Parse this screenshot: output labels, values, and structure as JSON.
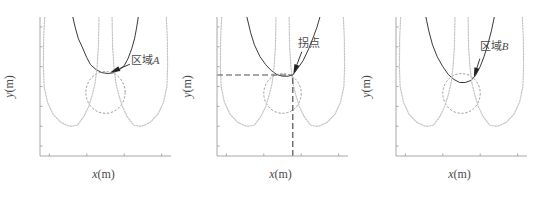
{
  "figure": {
    "panel_count": 3
  },
  "chart_data": [
    {
      "type": "line",
      "caption": "(a)",
      "xlabel": "x(m)",
      "ylabel": "y(m)",
      "xlim": [
        0.15,
        0.85
      ],
      "ylim": [
        0.15,
        0.85
      ],
      "xticks": [
        0.2,
        0.4,
        0.6,
        0.8
      ],
      "xtick_labels": [
        "0.2",
        "0.4",
        "0.6",
        "0.8"
      ],
      "yticks": [
        0.2,
        0.3,
        0.4,
        0.5,
        0.6,
        0.7,
        0.8
      ],
      "ytick_labels": [
        "0.2",
        "0.3",
        "0.4",
        "0.5",
        "0.6",
        "0.7",
        "0.8"
      ],
      "grid": false,
      "series": [
        {
          "name": "1",
          "style": "solid",
          "color": "#3a3a3a",
          "points": [
            [
              0.325,
              0.85
            ],
            [
              0.34,
              0.79
            ],
            [
              0.355,
              0.74
            ],
            [
              0.375,
              0.7
            ],
            [
              0.4,
              0.645
            ],
            [
              0.42,
              0.61
            ],
            [
              0.45,
              0.585
            ],
            [
              0.48,
              0.57
            ],
            [
              0.515,
              0.565
            ],
            [
              0.545,
              0.57
            ],
            [
              0.575,
              0.585
            ],
            [
              0.6,
              0.605
            ],
            [
              0.62,
              0.64
            ],
            [
              0.64,
              0.69
            ],
            [
              0.655,
              0.74
            ],
            [
              0.665,
              0.79
            ],
            [
              0.675,
              0.85
            ]
          ],
          "label_pos": [
            0.385,
            0.77
          ]
        },
        {
          "name": "2",
          "style": "dashed",
          "color": "#8a8a8a",
          "shape": "circle",
          "center": [
            0.5,
            0.47
          ],
          "radius": 0.105,
          "label_pos": [
            0.5,
            0.39
          ]
        },
        {
          "name": "3",
          "style": "dotted",
          "color": "#c4c4c4",
          "points": [
            [
              0.175,
              0.85
            ],
            [
              0.17,
              0.75
            ],
            [
              0.168,
              0.6
            ],
            [
              0.172,
              0.5
            ],
            [
              0.19,
              0.42
            ],
            [
              0.22,
              0.36
            ],
            [
              0.26,
              0.32
            ],
            [
              0.3,
              0.302
            ],
            [
              0.32,
              0.3
            ],
            [
              0.35,
              0.305
            ],
            [
              0.385,
              0.35
            ],
            [
              0.41,
              0.4
            ],
            [
              0.43,
              0.46
            ],
            [
              0.445,
              0.52
            ],
            [
              0.455,
              0.6
            ],
            [
              0.462,
              0.7
            ],
            [
              0.465,
              0.85
            ]
          ],
          "label_pos": [
            0.325,
            0.315
          ]
        },
        {
          "name": "3",
          "style": "dotted",
          "color": "#c4c4c4",
          "points": [
            [
              0.825,
              0.85
            ],
            [
              0.83,
              0.75
            ],
            [
              0.832,
              0.6
            ],
            [
              0.828,
              0.5
            ],
            [
              0.81,
              0.42
            ],
            [
              0.78,
              0.36
            ],
            [
              0.74,
              0.32
            ],
            [
              0.7,
              0.302
            ],
            [
              0.68,
              0.3
            ],
            [
              0.65,
              0.305
            ],
            [
              0.615,
              0.35
            ],
            [
              0.59,
              0.4
            ],
            [
              0.57,
              0.46
            ],
            [
              0.555,
              0.52
            ],
            [
              0.545,
              0.6
            ],
            [
              0.538,
              0.7
            ],
            [
              0.535,
              0.85
            ]
          ],
          "label_pos": [
            0.68,
            0.315
          ]
        }
      ],
      "annotations": [
        {
          "text": "区域A",
          "text_pos": [
            0.635,
            0.615
          ],
          "arrow_from": [
            0.63,
            0.612
          ],
          "arrow_to": [
            0.525,
            0.57
          ]
        }
      ],
      "guides": []
    },
    {
      "type": "line",
      "caption": "(b)",
      "xlabel": "x(m)",
      "ylabel": "y(m)",
      "xlim": [
        0.15,
        0.85
      ],
      "ylim": [
        0.15,
        0.85
      ],
      "xticks": [
        0.2,
        0.4,
        0.6,
        0.8
      ],
      "xtick_labels": [
        "0.2",
        "0.4",
        "0.6",
        "0.8"
      ],
      "yticks": [
        0.2,
        0.3,
        0.4,
        0.5,
        0.6,
        0.7,
        0.8
      ],
      "ytick_labels": [
        "0.2",
        "0.3",
        "0.4",
        "0.5",
        "0.6",
        "0.7",
        "0.8"
      ],
      "grid": false,
      "series": [
        {
          "name": "1",
          "style": "solid",
          "color": "#3a3a3a",
          "points": [
            [
              0.31,
              0.85
            ],
            [
              0.33,
              0.77
            ],
            [
              0.35,
              0.71
            ],
            [
              0.38,
              0.65
            ],
            [
              0.41,
              0.61
            ],
            [
              0.44,
              0.58
            ],
            [
              0.47,
              0.56
            ],
            [
              0.5,
              0.552
            ],
            [
              0.53,
              0.552
            ],
            [
              0.555,
              0.558
            ],
            [
              0.58,
              0.59
            ],
            [
              0.61,
              0.63
            ],
            [
              0.64,
              0.69
            ],
            [
              0.665,
              0.75
            ],
            [
              0.685,
              0.8
            ],
            [
              0.7,
              0.85
            ]
          ],
          "label_pos": [
            0.37,
            0.77
          ]
        },
        {
          "name": "2",
          "style": "dashed",
          "color": "#8a8a8a",
          "shape": "circle",
          "center": [
            0.5,
            0.465
          ],
          "radius": 0.1,
          "label_pos": [
            0.49,
            0.39
          ]
        },
        {
          "name": "3",
          "style": "dotted",
          "color": "#c4c4c4",
          "points": [
            [
              0.175,
              0.85
            ],
            [
              0.17,
              0.75
            ],
            [
              0.168,
              0.6
            ],
            [
              0.172,
              0.5
            ],
            [
              0.19,
              0.42
            ],
            [
              0.22,
              0.36
            ],
            [
              0.26,
              0.32
            ],
            [
              0.3,
              0.302
            ],
            [
              0.32,
              0.3
            ],
            [
              0.35,
              0.305
            ],
            [
              0.385,
              0.35
            ],
            [
              0.41,
              0.4
            ],
            [
              0.43,
              0.46
            ],
            [
              0.445,
              0.52
            ],
            [
              0.455,
              0.6
            ],
            [
              0.462,
              0.7
            ],
            [
              0.465,
              0.85
            ]
          ],
          "label_pos": [
            0.33,
            0.315
          ]
        },
        {
          "name": "3",
          "style": "dotted",
          "color": "#c4c4c4",
          "points": [
            [
              0.825,
              0.85
            ],
            [
              0.83,
              0.75
            ],
            [
              0.832,
              0.6
            ],
            [
              0.828,
              0.5
            ],
            [
              0.81,
              0.42
            ],
            [
              0.78,
              0.36
            ],
            [
              0.74,
              0.32
            ],
            [
              0.7,
              0.302
            ],
            [
              0.68,
              0.3
            ],
            [
              0.65,
              0.305
            ],
            [
              0.615,
              0.35
            ],
            [
              0.59,
              0.4
            ],
            [
              0.57,
              0.46
            ],
            [
              0.555,
              0.52
            ],
            [
              0.545,
              0.6
            ],
            [
              0.538,
              0.7
            ],
            [
              0.535,
              0.85
            ]
          ],
          "label_pos": [
            0.69,
            0.315
          ]
        }
      ],
      "annotations": [
        {
          "text": "拐点",
          "text_pos": [
            0.585,
            0.7
          ],
          "arrow_from": [
            0.603,
            0.675
          ],
          "arrow_to": [
            0.558,
            0.562
          ]
        }
      ],
      "guides": [
        {
          "orientation": "horizontal",
          "y": 0.558,
          "x_from": 0.15,
          "x_to": 0.555
        },
        {
          "orientation": "vertical",
          "x": 0.555,
          "y_from": 0.15,
          "y_to": 0.558
        }
      ]
    },
    {
      "type": "line",
      "caption": "(c)",
      "xlabel": "x(m)",
      "ylabel": "y(m)",
      "xlim": [
        0.15,
        0.85
      ],
      "ylim": [
        0.15,
        0.85
      ],
      "xticks": [
        0.2,
        0.4,
        0.6,
        0.8
      ],
      "xtick_labels": [
        "0.2",
        "0.4",
        "0.6",
        "0.8"
      ],
      "yticks": [
        0.2,
        0.3,
        0.4,
        0.5,
        0.6,
        0.7,
        0.8
      ],
      "ytick_labels": [
        "0.2",
        "0.3",
        "0.4",
        "0.5",
        "0.6",
        "0.7",
        "0.8"
      ],
      "grid": false,
      "series": [
        {
          "name": "1",
          "style": "solid",
          "color": "#3a3a3a",
          "points": [
            [
              0.31,
              0.85
            ],
            [
              0.325,
              0.78
            ],
            [
              0.345,
              0.71
            ],
            [
              0.37,
              0.65
            ],
            [
              0.4,
              0.6
            ],
            [
              0.43,
              0.56
            ],
            [
              0.46,
              0.535
            ],
            [
              0.49,
              0.52
            ],
            [
              0.52,
              0.52
            ],
            [
              0.55,
              0.53
            ],
            [
              0.575,
              0.555
            ],
            [
              0.6,
              0.6
            ],
            [
              0.62,
              0.65
            ],
            [
              0.64,
              0.71
            ],
            [
              0.66,
              0.78
            ],
            [
              0.675,
              0.85
            ]
          ],
          "label_pos": [
            0.37,
            0.77
          ]
        },
        {
          "name": "2",
          "style": "dashed",
          "color": "#8a8a8a",
          "shape": "circle",
          "center": [
            0.5,
            0.465
          ],
          "radius": 0.1,
          "label_pos": [
            0.5,
            0.39
          ]
        },
        {
          "name": "3",
          "style": "dotted",
          "color": "#c4c4c4",
          "points": [
            [
              0.175,
              0.85
            ],
            [
              0.17,
              0.75
            ],
            [
              0.168,
              0.6
            ],
            [
              0.172,
              0.5
            ],
            [
              0.19,
              0.42
            ],
            [
              0.22,
              0.36
            ],
            [
              0.26,
              0.32
            ],
            [
              0.3,
              0.302
            ],
            [
              0.32,
              0.3
            ],
            [
              0.35,
              0.305
            ],
            [
              0.385,
              0.35
            ],
            [
              0.41,
              0.4
            ],
            [
              0.43,
              0.46
            ],
            [
              0.445,
              0.52
            ],
            [
              0.455,
              0.6
            ],
            [
              0.462,
              0.7
            ],
            [
              0.465,
              0.85
            ]
          ],
          "label_pos": [
            0.33,
            0.315
          ]
        },
        {
          "name": "3",
          "style": "dotted",
          "color": "#c4c4c4",
          "points": [
            [
              0.825,
              0.85
            ],
            [
              0.83,
              0.75
            ],
            [
              0.832,
              0.6
            ],
            [
              0.828,
              0.5
            ],
            [
              0.81,
              0.42
            ],
            [
              0.78,
              0.36
            ],
            [
              0.74,
              0.32
            ],
            [
              0.7,
              0.302
            ],
            [
              0.68,
              0.3
            ],
            [
              0.65,
              0.305
            ],
            [
              0.615,
              0.35
            ],
            [
              0.59,
              0.4
            ],
            [
              0.57,
              0.46
            ],
            [
              0.555,
              0.52
            ],
            [
              0.545,
              0.6
            ],
            [
              0.538,
              0.7
            ],
            [
              0.535,
              0.85
            ]
          ],
          "label_pos": [
            0.69,
            0.315
          ]
        }
      ],
      "annotations": [
        {
          "text": "区域B",
          "text_pos": [
            0.598,
            0.685
          ],
          "arrow_from": [
            0.598,
            0.64
          ],
          "arrow_to": [
            0.566,
            0.545
          ]
        }
      ],
      "guides": []
    }
  ]
}
